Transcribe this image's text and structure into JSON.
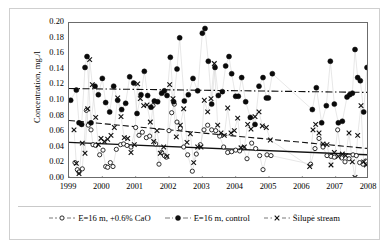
{
  "chart_data": {
    "type": "scatter",
    "title": "",
    "xlabel": "",
    "ylabel": "Concentration, mg./l",
    "xlim": [
      1999,
      2008
    ],
    "ylim": [
      0.0,
      0.2
    ],
    "grid": false,
    "legend_position": "bottom",
    "x_ticks": [
      "1999",
      "2000",
      "2001",
      "2002",
      "2003",
      "2004",
      "2005",
      "2006",
      "2007",
      "2008"
    ],
    "y_ticks": [
      "0.00",
      "0.02",
      "0.04",
      "0.06",
      "0.08",
      "0.10",
      "0.12",
      "0.14",
      "0.16",
      "0.18",
      "0.20"
    ],
    "series": [
      {
        "name": "E=16 m, +0.6% CaO",
        "marker": "open-circle",
        "color": "#1a1a1a",
        "trend": {
          "style": "solid",
          "y_start": 0.047,
          "y_end": 0.031
        },
        "points": [
          [
            1999.18,
            0.021
          ],
          [
            1999.25,
            0.012
          ],
          [
            1999.3,
            0.009
          ],
          [
            1999.4,
            0.013
          ],
          [
            1999.52,
            0.088
          ],
          [
            1999.58,
            0.069
          ],
          [
            1999.66,
            0.063
          ],
          [
            1999.72,
            0.044
          ],
          [
            1999.8,
            0.043
          ],
          [
            1999.92,
            0.031
          ],
          [
            2000.02,
            0.037
          ],
          [
            2000.1,
            0.016
          ],
          [
            2000.16,
            0.015
          ],
          [
            2000.24,
            0.021
          ],
          [
            2000.32,
            0.016
          ],
          [
            2000.42,
            0.038
          ],
          [
            2000.55,
            0.044
          ],
          [
            2000.64,
            0.045
          ],
          [
            2000.74,
            0.043
          ],
          [
            2000.86,
            0.041
          ],
          [
            2001.0,
            0.066
          ],
          [
            2001.1,
            0.056
          ],
          [
            2001.2,
            0.06
          ],
          [
            2001.32,
            0.053
          ],
          [
            2001.42,
            0.055
          ],
          [
            2001.52,
            0.094
          ],
          [
            2001.6,
            0.045
          ],
          [
            2001.7,
            0.019
          ],
          [
            2001.78,
            0.034
          ],
          [
            2001.86,
            0.03
          ],
          [
            2001.92,
            0.028
          ],
          [
            2002.0,
            0.062
          ],
          [
            2002.08,
            0.085
          ],
          [
            2002.16,
            0.096
          ],
          [
            2002.24,
            0.073
          ],
          [
            2002.34,
            0.065
          ],
          [
            2002.44,
            0.041
          ],
          [
            2002.56,
            0.031
          ],
          [
            2002.7,
            0.01
          ],
          [
            2002.82,
            0.032
          ],
          [
            2002.94,
            0.044
          ],
          [
            2003.05,
            0.063
          ],
          [
            2003.16,
            0.069
          ],
          [
            2003.28,
            0.063
          ],
          [
            2003.4,
            0.062
          ],
          [
            2003.52,
            0.055
          ],
          [
            2003.64,
            0.041
          ],
          [
            2003.76,
            0.034
          ],
          [
            2003.88,
            0.035
          ],
          [
            2004.0,
            0.037
          ],
          [
            2004.12,
            0.036
          ],
          [
            2004.22,
            0.04
          ],
          [
            2004.34,
            0.026
          ],
          [
            2004.48,
            0.046
          ],
          [
            2004.6,
            0.039
          ],
          [
            2004.72,
            0.03
          ],
          [
            2004.82,
            0.012
          ],
          [
            2004.94,
            0.031
          ],
          [
            2005.06,
            0.03
          ],
          [
            2006.25,
            0.019
          ],
          [
            2006.38,
            0.039
          ],
          [
            2006.5,
            0.052
          ],
          [
            2006.62,
            0.041
          ],
          [
            2006.74,
            0.03
          ],
          [
            2006.86,
            0.029
          ],
          [
            2006.96,
            0.028
          ],
          [
            2007.06,
            0.063
          ],
          [
            2007.18,
            0.027
          ],
          [
            2007.28,
            0.022
          ],
          [
            2007.4,
            0.026
          ],
          [
            2007.52,
            0.031
          ],
          [
            2007.62,
            0.03
          ],
          [
            2007.72,
            0.021
          ],
          [
            2007.82,
            0.019
          ],
          [
            2007.9,
            0.023
          ]
        ]
      },
      {
        "name": "E=16 m, control",
        "marker": "filled-circle",
        "color": "#0a0a0a",
        "trend": {
          "style": "dash-dot",
          "y_start": 0.116,
          "y_end": 0.111
        },
        "points": [
          [
            1999.05,
            0.101
          ],
          [
            1999.22,
            0.114
          ],
          [
            1999.3,
            0.072
          ],
          [
            1999.38,
            0.07
          ],
          [
            1999.48,
            0.143
          ],
          [
            1999.54,
            0.157
          ],
          [
            1999.66,
            0.072
          ],
          [
            1999.78,
            0.119
          ],
          [
            1999.88,
            0.108
          ],
          [
            2000.0,
            0.129
          ],
          [
            2000.1,
            0.098
          ],
          [
            2000.22,
            0.086
          ],
          [
            2000.34,
            0.119
          ],
          [
            2000.46,
            0.101
          ],
          [
            2000.58,
            0.089
          ],
          [
            2000.7,
            0.097
          ],
          [
            2000.82,
            0.131
          ],
          [
            2000.94,
            0.123
          ],
          [
            2001.04,
            0.084
          ],
          [
            2001.16,
            0.108
          ],
          [
            2001.26,
            0.138
          ],
          [
            2001.36,
            0.107
          ],
          [
            2001.46,
            0.092
          ],
          [
            2001.56,
            0.1
          ],
          [
            2001.66,
            0.099
          ],
          [
            2001.78,
            0.11
          ],
          [
            2001.86,
            0.113
          ],
          [
            2001.94,
            0.107
          ],
          [
            2002.04,
            0.156
          ],
          [
            2002.14,
            0.099
          ],
          [
            2002.24,
            0.141
          ],
          [
            2002.32,
            0.181
          ],
          [
            2002.46,
            0.1
          ],
          [
            2002.58,
            0.108
          ],
          [
            2002.72,
            0.129
          ],
          [
            2002.86,
            0.113
          ],
          [
            2003.0,
            0.187
          ],
          [
            2003.08,
            0.193
          ],
          [
            2003.18,
            0.151
          ],
          [
            2003.28,
            0.096
          ],
          [
            2003.38,
            0.143
          ],
          [
            2003.48,
            0.107
          ],
          [
            2003.6,
            0.112
          ],
          [
            2003.7,
            0.145
          ],
          [
            2003.8,
            0.157
          ],
          [
            2003.88,
            0.135
          ],
          [
            2004.0,
            0.106
          ],
          [
            2004.08,
            0.106
          ],
          [
            2004.18,
            0.13
          ],
          [
            2004.3,
            0.099
          ],
          [
            2004.44,
            0.079
          ],
          [
            2004.58,
            0.07
          ],
          [
            2004.7,
            0.119
          ],
          [
            2004.82,
            0.13
          ],
          [
            2004.92,
            0.104
          ],
          [
            2004.98,
            0.104
          ],
          [
            2005.1,
            0.135
          ],
          [
            2006.3,
            0.089
          ],
          [
            2006.42,
            0.117
          ],
          [
            2006.58,
            0.072
          ],
          [
            2006.72,
            0.094
          ],
          [
            2006.84,
            0.151
          ],
          [
            2006.96,
            0.096
          ],
          [
            2007.08,
            0.072
          ],
          [
            2007.2,
            0.074
          ],
          [
            2007.34,
            0.105
          ],
          [
            2007.42,
            0.108
          ],
          [
            2007.5,
            0.11
          ],
          [
            2007.58,
            0.166
          ],
          [
            2007.66,
            0.13
          ],
          [
            2007.74,
            0.126
          ],
          [
            2007.84,
            0.086
          ],
          [
            2007.94,
            0.143
          ]
        ]
      },
      {
        "name": "Šilupė stream",
        "marker": "cross",
        "color": "#111111",
        "trend": {
          "style": "dashed",
          "y_start": 0.075,
          "y_end": 0.039
        },
        "points": [
          [
            1999.15,
            0.063
          ],
          [
            1999.22,
            0.02
          ],
          [
            1999.3,
            0.007
          ],
          [
            1999.4,
            0.046
          ],
          [
            1999.48,
            0.033
          ],
          [
            1999.56,
            0.09
          ],
          [
            1999.62,
            0.153
          ],
          [
            1999.7,
            0.121
          ],
          [
            1999.8,
            0.079
          ],
          [
            1999.88,
            0.044
          ],
          [
            1999.96,
            0.052
          ],
          [
            2000.06,
            0.048
          ],
          [
            2000.16,
            0.051
          ],
          [
            2000.26,
            0.056
          ],
          [
            2000.36,
            0.066
          ],
          [
            2000.46,
            0.104
          ],
          [
            2000.56,
            0.08
          ],
          [
            2000.66,
            0.053
          ],
          [
            2000.76,
            0.052
          ],
          [
            2000.86,
            0.034
          ],
          [
            2000.96,
            0.044
          ],
          [
            2001.06,
            0.122
          ],
          [
            2001.14,
            0.103
          ],
          [
            2001.24,
            0.094
          ],
          [
            2001.34,
            0.095
          ],
          [
            2001.44,
            0.073
          ],
          [
            2001.54,
            0.048
          ],
          [
            2001.64,
            0.062
          ],
          [
            2001.74,
            0.033
          ],
          [
            2001.84,
            0.041
          ],
          [
            2001.94,
            0.029
          ],
          [
            2002.02,
            0.121
          ],
          [
            2002.12,
            0.103
          ],
          [
            2002.22,
            0.054
          ],
          [
            2002.34,
            0.069
          ],
          [
            2002.44,
            0.09
          ],
          [
            2002.54,
            0.047
          ],
          [
            2002.64,
            0.058
          ],
          [
            2002.74,
            0.021
          ],
          [
            2002.86,
            0.041
          ],
          [
            2002.96,
            0.041
          ],
          [
            2003.06,
            0.101
          ],
          [
            2003.16,
            0.086
          ],
          [
            2003.26,
            0.103
          ],
          [
            2003.36,
            0.148
          ],
          [
            2003.46,
            0.069
          ],
          [
            2003.56,
            0.059
          ],
          [
            2003.66,
            0.056
          ],
          [
            2003.76,
            0.091
          ],
          [
            2003.86,
            0.059
          ],
          [
            2003.96,
            0.062
          ],
          [
            2004.06,
            0.078
          ],
          [
            2004.16,
            0.04
          ],
          [
            2004.26,
            0.041
          ],
          [
            2004.36,
            0.07
          ],
          [
            2004.46,
            0.064
          ],
          [
            2004.58,
            0.08
          ],
          [
            2004.7,
            0.086
          ],
          [
            2004.8,
            0.068
          ],
          [
            2004.92,
            0.066
          ],
          [
            2005.04,
            0.05
          ],
          [
            2006.22,
            0.016
          ],
          [
            2006.32,
            0.063
          ],
          [
            2006.4,
            0.07
          ],
          [
            2006.5,
            0.059
          ],
          [
            2006.62,
            0.045
          ],
          [
            2006.74,
            0.044
          ],
          [
            2006.86,
            0.018
          ],
          [
            2006.96,
            0.034
          ],
          [
            2007.08,
            0.029
          ],
          [
            2007.2,
            0.032
          ],
          [
            2007.3,
            0.03
          ],
          [
            2007.4,
            0.059
          ],
          [
            2007.5,
            0.022
          ],
          [
            2007.58,
            0.002
          ],
          [
            2007.66,
            0.056
          ],
          [
            2007.76,
            0.094
          ],
          [
            2007.84,
            0.022
          ],
          [
            2007.92,
            0.018
          ]
        ]
      }
    ]
  },
  "legend": {
    "items": [
      {
        "label": "E=16 m, +0.6% CaO",
        "marker": "open-circle"
      },
      {
        "label": "E=16 m, control",
        "marker": "filled-circle"
      },
      {
        "label": "Šilupė stream",
        "marker": "cross"
      }
    ]
  }
}
